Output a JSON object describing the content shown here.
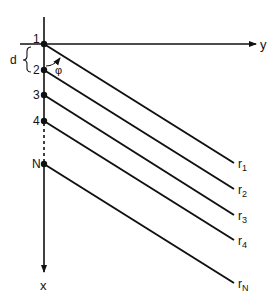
{
  "diagram": {
    "type": "antenna-array-geometry",
    "axes": {
      "horizontal_label": "y",
      "vertical_label": "x"
    },
    "spacing_label": "d",
    "angle_label": "φ",
    "elements": [
      {
        "label": "1",
        "ray_label": "r",
        "ray_sub": "1"
      },
      {
        "label": "2",
        "ray_label": "r",
        "ray_sub": "2"
      },
      {
        "label": "3",
        "ray_label": "r",
        "ray_sub": "3"
      },
      {
        "label": "4",
        "ray_label": "r",
        "ray_sub": "4"
      },
      {
        "label": "N",
        "ray_label": "r",
        "ray_sub": "N"
      }
    ],
    "colors": {
      "ink": "#111111",
      "background": "#ffffff"
    }
  }
}
